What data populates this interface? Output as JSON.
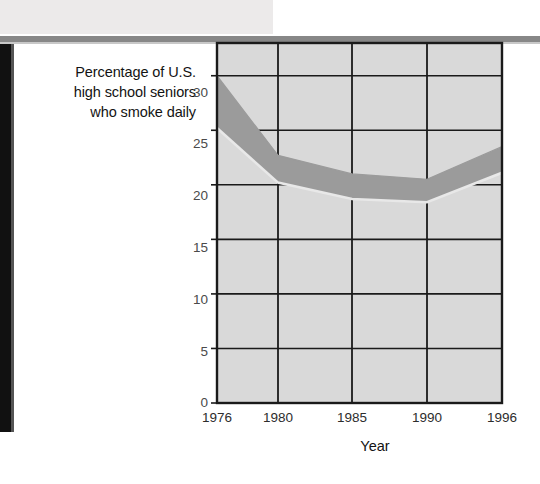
{
  "page": {
    "background_color": "#ffffff",
    "scan_band_color": "#eceaea",
    "scan_rule_color": "#878787",
    "scan_edge_color": "#111111"
  },
  "chart_data": {
    "type": "area",
    "title": "",
    "ylabel": "Percentage of U.S. high school seniors who smoke daily",
    "ylabel_lines": [
      "Percentage of U.S.",
      "high school seniors",
      "who smoke daily"
    ],
    "xlabel": "Year",
    "x": [
      1976,
      1980,
      1985,
      1990,
      1996
    ],
    "xtick_labels": [
      "1976",
      "1980",
      "1985",
      "1990",
      "1996"
    ],
    "ytick_labels": [
      "0",
      "5",
      "10",
      "15",
      "20",
      "25",
      "30"
    ],
    "yticks": [
      0,
      5,
      10,
      15,
      20,
      25,
      30
    ],
    "ylim": [
      0,
      33
    ],
    "xlim": [
      1976,
      1996
    ],
    "grid": true,
    "legend": "none",
    "band_color": "#9b9b9b",
    "band_edge_color": "#e8e8e8",
    "plot_background_color": "#d9d9d9",
    "axis_color": "#1a1a1a",
    "series": [
      {
        "name": "upper bound",
        "values": [
          30.0,
          22.7,
          21.0,
          20.5,
          23.5
        ]
      },
      {
        "name": "lower bound",
        "values": [
          25.2,
          20.2,
          18.7,
          18.4,
          21.1
        ]
      }
    ],
    "annotations": []
  }
}
